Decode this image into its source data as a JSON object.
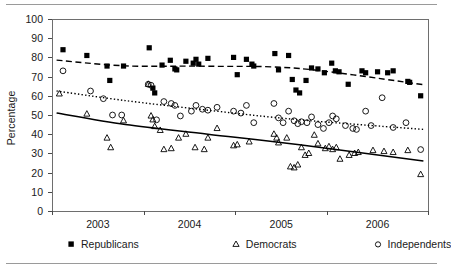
{
  "chart_data": {
    "type": "scatter",
    "title": "",
    "subtitle": "",
    "xlabel": "",
    "ylabel": "Percentage",
    "xlim": [
      2002.5,
      2006.6
    ],
    "ylim": [
      0,
      100
    ],
    "grid": false,
    "legend_position": "bottom",
    "y_ticks": [
      0,
      10,
      20,
      30,
      40,
      50,
      60,
      70,
      80,
      90,
      100
    ],
    "y_tick_labels": [
      "0",
      "10",
      "20",
      "30",
      "40",
      "50",
      "60",
      "70",
      "80",
      "90",
      "100"
    ],
    "x_ticks": [
      2002.5,
      2003.5,
      2004.5,
      2005.5,
      2006.6
    ],
    "x_tick_labels": [
      "2003",
      "2004",
      "2005",
      "2006"
    ],
    "x_label_positions": [
      2003.0,
      2004.0,
      2005.0,
      2006.05
    ],
    "series": [
      {
        "name": "Republicans",
        "marker": "filled-square",
        "color": "#000000",
        "trend_style": "dashed",
        "points": [
          [
            2002.62,
            84
          ],
          [
            2002.88,
            81
          ],
          [
            2003.1,
            75.5
          ],
          [
            2003.13,
            68
          ],
          [
            2003.28,
            75.5
          ],
          [
            2003.56,
            85
          ],
          [
            2003.6,
            64
          ],
          [
            2003.62,
            61.5
          ],
          [
            2003.7,
            76
          ],
          [
            2003.79,
            78.5
          ],
          [
            2003.84,
            74
          ],
          [
            2003.86,
            73.5
          ],
          [
            2003.96,
            78
          ],
          [
            2004.04,
            77
          ],
          [
            2004.07,
            79
          ],
          [
            2004.1,
            76.5
          ],
          [
            2004.2,
            79.5
          ],
          [
            2004.48,
            80
          ],
          [
            2004.52,
            71
          ],
          [
            2004.62,
            79
          ],
          [
            2004.68,
            76.5
          ],
          [
            2004.7,
            75.5
          ],
          [
            2004.93,
            82
          ],
          [
            2004.97,
            73.5
          ],
          [
            2005.08,
            81
          ],
          [
            2005.12,
            68.5
          ],
          [
            2005.16,
            63
          ],
          [
            2005.2,
            61.5
          ],
          [
            2005.27,
            68
          ],
          [
            2005.33,
            74.5
          ],
          [
            2005.4,
            74
          ],
          [
            2005.47,
            72
          ],
          [
            2005.55,
            77
          ],
          [
            2005.59,
            73
          ],
          [
            2005.63,
            72.5
          ],
          [
            2005.73,
            66
          ],
          [
            2005.88,
            73
          ],
          [
            2005.92,
            72
          ],
          [
            2006.05,
            72.5
          ],
          [
            2006.16,
            72
          ],
          [
            2006.22,
            73
          ],
          [
            2006.38,
            67.5
          ],
          [
            2006.4,
            67
          ],
          [
            2006.52,
            60
          ]
        ],
        "trend": [
          [
            2002.55,
            78.6
          ],
          [
            2003.3,
            75.6
          ],
          [
            2004.2,
            75.4
          ],
          [
            2005.2,
            74.2
          ],
          [
            2006.55,
            65.8
          ]
        ]
      },
      {
        "name": "Democrats",
        "marker": "open-triangle",
        "color": "#000000",
        "trend_style": "solid",
        "points": [
          [
            2002.58,
            61
          ],
          [
            2002.88,
            50.5
          ],
          [
            2003.1,
            38
          ],
          [
            2003.14,
            33
          ],
          [
            2003.28,
            47
          ],
          [
            2003.55,
            66
          ],
          [
            2003.58,
            49.5
          ],
          [
            2003.6,
            47.5
          ],
          [
            2003.62,
            44
          ],
          [
            2003.68,
            42
          ],
          [
            2003.72,
            32
          ],
          [
            2003.8,
            32.5
          ],
          [
            2003.88,
            38
          ],
          [
            2003.96,
            40
          ],
          [
            2004.06,
            33
          ],
          [
            2004.16,
            32
          ],
          [
            2004.2,
            38
          ],
          [
            2004.3,
            43
          ],
          [
            2004.48,
            34
          ],
          [
            2004.52,
            34.5
          ],
          [
            2004.65,
            36
          ],
          [
            2004.92,
            40
          ],
          [
            2004.95,
            38
          ],
          [
            2004.97,
            35.5
          ],
          [
            2005.06,
            38
          ],
          [
            2005.1,
            23
          ],
          [
            2005.14,
            22.5
          ],
          [
            2005.18,
            24
          ],
          [
            2005.22,
            33
          ],
          [
            2005.26,
            29
          ],
          [
            2005.3,
            30
          ],
          [
            2005.36,
            39.5
          ],
          [
            2005.4,
            35
          ],
          [
            2005.48,
            32.5
          ],
          [
            2005.52,
            33.5
          ],
          [
            2005.56,
            32
          ],
          [
            2005.6,
            33
          ],
          [
            2005.64,
            27
          ],
          [
            2005.74,
            29
          ],
          [
            2005.8,
            30
          ],
          [
            2005.84,
            30.5
          ],
          [
            2006.0,
            31.5
          ],
          [
            2006.12,
            31
          ],
          [
            2006.22,
            30.5
          ],
          [
            2006.38,
            31.5
          ],
          [
            2006.52,
            19
          ]
        ],
        "trend": [
          [
            2002.55,
            51
          ],
          [
            2003.3,
            45
          ],
          [
            2004.2,
            40
          ],
          [
            2005.2,
            34.5
          ],
          [
            2006.55,
            26
          ]
        ]
      },
      {
        "name": "Independents",
        "marker": "open-circle",
        "color": "#000000",
        "trend_style": "dotted",
        "points": [
          [
            2002.62,
            73
          ],
          [
            2002.92,
            62.5
          ],
          [
            2003.06,
            58.5
          ],
          [
            2003.16,
            50
          ],
          [
            2003.26,
            50
          ],
          [
            2003.55,
            66
          ],
          [
            2003.58,
            65.5
          ],
          [
            2003.64,
            47.5
          ],
          [
            2003.72,
            57
          ],
          [
            2003.8,
            56
          ],
          [
            2003.84,
            55
          ],
          [
            2003.9,
            49.5
          ],
          [
            2004.02,
            52
          ],
          [
            2004.07,
            55
          ],
          [
            2004.14,
            53
          ],
          [
            2004.2,
            52.5
          ],
          [
            2004.3,
            54
          ],
          [
            2004.48,
            52
          ],
          [
            2004.56,
            51
          ],
          [
            2004.62,
            55
          ],
          [
            2004.7,
            46
          ],
          [
            2004.92,
            56
          ],
          [
            2004.97,
            48.5
          ],
          [
            2005.02,
            46
          ],
          [
            2005.08,
            52
          ],
          [
            2005.14,
            47
          ],
          [
            2005.18,
            45.5
          ],
          [
            2005.22,
            46.5
          ],
          [
            2005.28,
            46
          ],
          [
            2005.33,
            49
          ],
          [
            2005.4,
            45
          ],
          [
            2005.46,
            43
          ],
          [
            2005.52,
            46
          ],
          [
            2005.56,
            49.5
          ],
          [
            2005.6,
            48
          ],
          [
            2005.7,
            44.5
          ],
          [
            2005.78,
            43
          ],
          [
            2005.82,
            42.5
          ],
          [
            2005.92,
            52
          ],
          [
            2005.98,
            44.5
          ],
          [
            2006.1,
            59
          ],
          [
            2006.22,
            43.5
          ],
          [
            2006.36,
            46
          ],
          [
            2006.52,
            32
          ]
        ],
        "trend": [
          [
            2002.55,
            62.5
          ],
          [
            2003.3,
            57.5
          ],
          [
            2004.2,
            52.5
          ],
          [
            2005.2,
            47.5
          ],
          [
            2006.55,
            42.5
          ]
        ]
      }
    ]
  },
  "legend": {
    "items": [
      {
        "label": "Republicans",
        "marker": "filled-square"
      },
      {
        "label": "Democrats",
        "marker": "open-triangle"
      },
      {
        "label": "Independents",
        "marker": "open-circle"
      }
    ]
  }
}
